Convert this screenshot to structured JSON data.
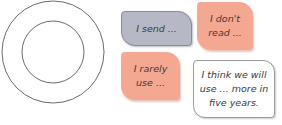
{
  "diagram": {
    "circles": {
      "outer_radius": 51,
      "inner_radius": 31,
      "stroke": "#6b6b6b"
    }
  },
  "bubbles": [
    {
      "id": "i-send",
      "text": "I send ...",
      "color": "#b7b8c6"
    },
    {
      "id": "i-dont-read",
      "text": "I don't read ...",
      "color": "#f4a892"
    },
    {
      "id": "i-rarely-use",
      "text": "I rarely use ...",
      "color": "#f4a892"
    },
    {
      "id": "i-think",
      "text": "I think we will use ... more in five years.",
      "color": "#ffffff"
    }
  ]
}
